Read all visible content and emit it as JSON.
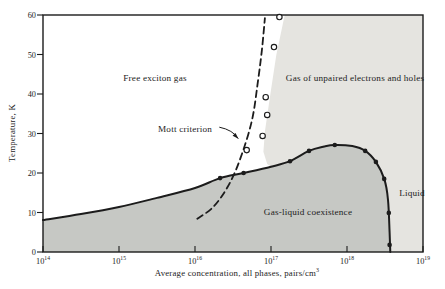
{
  "figure": {
    "background": "#ffffff",
    "line_color": "#1c1c1c",
    "text_color": "#1c1c1c"
  },
  "chart_data": {
    "type": "line",
    "title": "",
    "xlabel_base": "Average concentration, all phases, pairs/cm",
    "xlabel_exp": "3",
    "ylabel": "Temperature, K",
    "x_scale": "log",
    "xlim_log": [
      14,
      19
    ],
    "ylim": [
      0,
      60
    ],
    "grid": false,
    "x_ticks": [
      {
        "base": "10",
        "exp": "14"
      },
      {
        "base": "10",
        "exp": "15"
      },
      {
        "base": "10",
        "exp": "16"
      },
      {
        "base": "10",
        "exp": "17"
      },
      {
        "base": "10",
        "exp": "18"
      },
      {
        "base": "10",
        "exp": "19"
      }
    ],
    "y_ticks": [
      0,
      10,
      20,
      30,
      40,
      50,
      60
    ],
    "regions": [
      {
        "name": "unpaired-gas-and-liquid",
        "color": "#e5e4e0",
        "points": [
          [
            17.18,
            60
          ],
          [
            19,
            60
          ],
          [
            19,
            0
          ],
          [
            18.57,
            0
          ],
          [
            18.56,
            5.0
          ],
          [
            18.54,
            13.2
          ],
          [
            18.49,
            18.5
          ],
          [
            18.38,
            22.8
          ],
          [
            18.24,
            25.6
          ],
          [
            18.07,
            26.8
          ],
          [
            17.84,
            27.1
          ],
          [
            17.7,
            26.7
          ],
          [
            17.5,
            25.6
          ],
          [
            17.25,
            23.0
          ],
          [
            17.0,
            21.6
          ],
          [
            16.95,
            22.3
          ],
          [
            16.9,
            25.4
          ],
          [
            16.92,
            30.5
          ],
          [
            16.99,
            39.7
          ],
          [
            17.07,
            49.9
          ],
          [
            17.18,
            60
          ]
        ]
      },
      {
        "name": "gas-liquid-coexistence",
        "color": "#c6c8c4",
        "points": [
          [
            14,
            0
          ],
          [
            14,
            8.1
          ],
          [
            14.5,
            9.6
          ],
          [
            15,
            11.4
          ],
          [
            15.5,
            13.7
          ],
          [
            16,
            16.2
          ],
          [
            16.33,
            18.7
          ],
          [
            16.64,
            20.0
          ],
          [
            17.0,
            21.6
          ],
          [
            17.25,
            23.0
          ],
          [
            17.5,
            25.6
          ],
          [
            17.7,
            26.7
          ],
          [
            17.84,
            27.1
          ],
          [
            18.07,
            26.8
          ],
          [
            18.24,
            25.6
          ],
          [
            18.38,
            22.8
          ],
          [
            18.49,
            18.5
          ],
          [
            18.54,
            13.2
          ],
          [
            18.56,
            5.0
          ],
          [
            18.57,
            0
          ]
        ]
      }
    ],
    "series": [
      {
        "name": "coexistence-curve",
        "style": "solid",
        "width": 2,
        "points": [
          [
            14,
            8.1
          ],
          [
            14.5,
            9.6
          ],
          [
            15,
            11.4
          ],
          [
            15.5,
            13.7
          ],
          [
            16,
            16.2
          ],
          [
            16.33,
            18.7
          ],
          [
            16.64,
            20.0
          ],
          [
            17.0,
            21.6
          ],
          [
            17.25,
            23.0
          ],
          [
            17.5,
            25.6
          ],
          [
            17.7,
            26.7
          ],
          [
            17.84,
            27.1
          ],
          [
            18.07,
            26.8
          ],
          [
            18.24,
            25.6
          ],
          [
            18.38,
            22.8
          ],
          [
            18.49,
            18.5
          ],
          [
            18.54,
            13.2
          ],
          [
            18.56,
            5.0
          ],
          [
            18.57,
            0
          ]
        ]
      },
      {
        "name": "mott-criterion-line",
        "style": "dashed",
        "width": 1.8,
        "points": [
          [
            16.03,
            8.4
          ],
          [
            16.24,
            11.4
          ],
          [
            16.43,
            16.5
          ],
          [
            16.59,
            23.3
          ],
          [
            16.75,
            33.4
          ],
          [
            16.83,
            43.5
          ],
          [
            16.88,
            51.1
          ],
          [
            16.92,
            59.2
          ]
        ]
      }
    ],
    "markers": [
      {
        "name": "mott-open-circles",
        "type": "open-circle",
        "points": [
          [
            16.68,
            25.8
          ],
          [
            16.89,
            29.4
          ],
          [
            16.95,
            34.7
          ],
          [
            16.93,
            39.2
          ],
          [
            17.04,
            51.9
          ],
          [
            17.11,
            59.5
          ]
        ]
      },
      {
        "name": "coexistence-data-points",
        "type": "filled-dot",
        "points": [
          [
            16.33,
            18.7
          ],
          [
            16.64,
            20.0
          ],
          [
            17.25,
            23.0
          ],
          [
            17.5,
            25.6
          ],
          [
            17.84,
            27.1
          ],
          [
            18.24,
            25.6
          ],
          [
            18.38,
            22.8
          ],
          [
            18.49,
            18.5
          ],
          [
            18.55,
            9.9
          ],
          [
            18.56,
            1.8
          ]
        ]
      }
    ],
    "labels": {
      "free_exciton_gas": "Free exciton gas",
      "gas_unpaired": "Gas of unpaired electrons and holes",
      "gas_liquid": "Gas-liquid coexistence",
      "liquid": "Liquid",
      "mott": "Mott criterion"
    },
    "annotation_arrow": {
      "from": [
        16.32,
        31.6
      ],
      "to": [
        16.57,
        28.7
      ]
    }
  }
}
